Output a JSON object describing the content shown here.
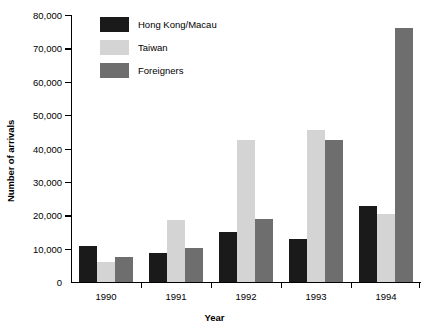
{
  "chart_data": {
    "type": "bar",
    "title": "",
    "subtitle": "",
    "xlabel": "Year",
    "ylabel": "Number of arrivals",
    "categories": [
      "1990",
      "1991",
      "1992",
      "1993",
      "1994"
    ],
    "series": [
      {
        "name": "Hong Kong/Macau",
        "color": "#1a1a1a",
        "values": [
          10700,
          8700,
          15000,
          13000,
          22800
        ]
      },
      {
        "name": "Taiwan",
        "color": "#d4d4d4",
        "values": [
          6000,
          18500,
          42500,
          45500,
          20300
        ]
      },
      {
        "name": "Foreigners",
        "color": "#6e6e6e",
        "values": [
          7500,
          10300,
          19000,
          42500,
          76000
        ]
      }
    ],
    "ylim": [
      0,
      80000
    ],
    "ytick_values": [
      0,
      10000,
      20000,
      30000,
      40000,
      50000,
      60000,
      70000,
      80000
    ],
    "ytick_labels": [
      "0",
      "10,000",
      "20,000",
      "30,000",
      "40,000",
      "50,000",
      "60,000",
      "70,000",
      "80,000"
    ],
    "grid": false,
    "legend_position": "top-left-inside",
    "legend_entries": [
      "Hong Kong/Macau",
      "Taiwan",
      "Foreigners"
    ]
  }
}
